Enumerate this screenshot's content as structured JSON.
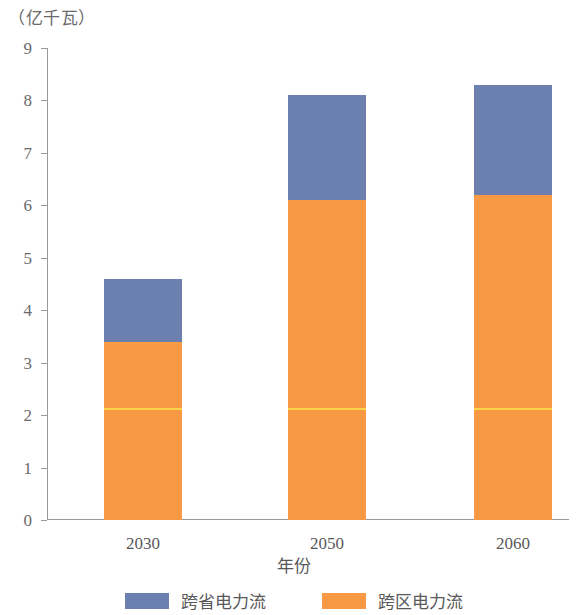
{
  "chart_data": {
    "type": "bar",
    "subtype": "stacked",
    "title": "",
    "unit_label": "（亿千瓦）",
    "xlabel": "年份",
    "ylabel": "",
    "categories": [
      "2030",
      "2050",
      "2060"
    ],
    "ylim": [
      0,
      9
    ],
    "yticks": [
      0,
      1,
      2,
      3,
      4,
      5,
      6,
      7,
      8,
      9
    ],
    "ytick_labels": [
      "0",
      "1",
      "2",
      "3",
      "4",
      "5",
      "6",
      "7",
      "8",
      "9"
    ],
    "grid": false,
    "legend_position": "bottom",
    "series": [
      {
        "name": "跨区电力流",
        "color": "#f79a43",
        "values": [
          3.4,
          6.1,
          6.2
        ]
      },
      {
        "name": "跨省电力流",
        "color": "#6b80ae",
        "values": [
          1.2,
          2.0,
          2.1
        ]
      }
    ],
    "totals": [
      4.6,
      8.1,
      8.3
    ],
    "annotations": [
      {
        "type": "inner-line",
        "color": "#ffd24a",
        "values": [
          2.1,
          2.1,
          2.1
        ]
      }
    ]
  },
  "legend": {
    "items": [
      {
        "label": "跨省电力流",
        "color": "#6b80ae"
      },
      {
        "label": "跨区电力流",
        "color": "#f79a43"
      }
    ]
  }
}
